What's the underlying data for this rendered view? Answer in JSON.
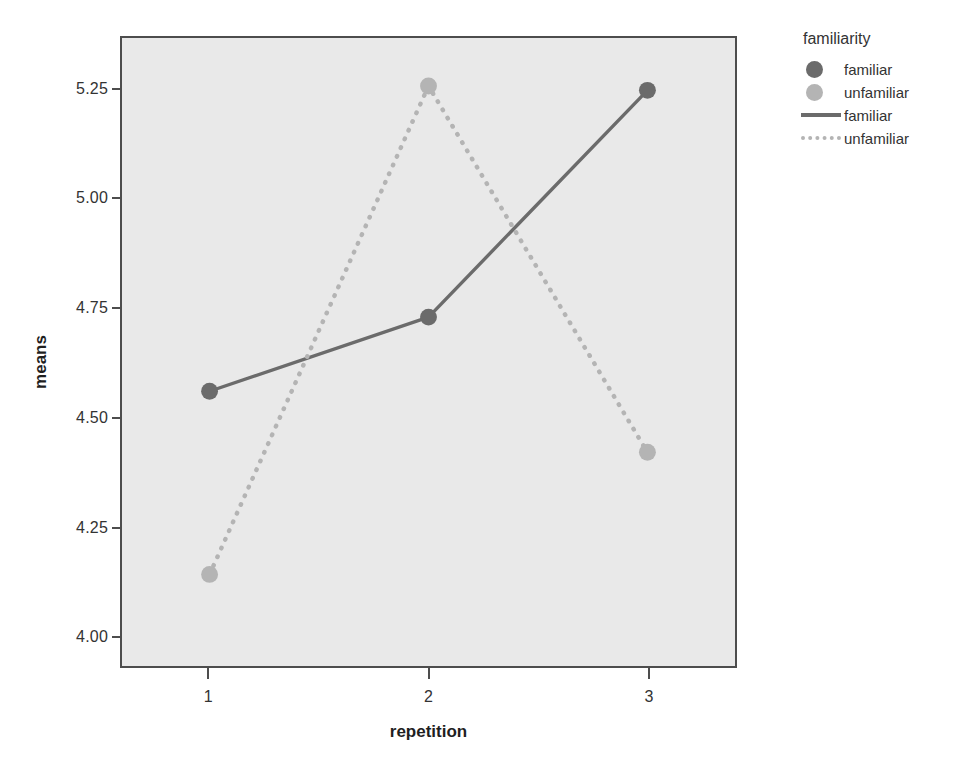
{
  "chart_data": {
    "type": "line",
    "title": "",
    "xlabel": "repetition",
    "ylabel": "means",
    "categories": [
      "1",
      "2",
      "3"
    ],
    "x": [
      1,
      2,
      3
    ],
    "xlim": [
      0.6,
      3.4
    ],
    "ylim": [
      3.93,
      5.37
    ],
    "yticks": [
      "4.00",
      "4.25",
      "4.50",
      "4.75",
      "5.00",
      "5.25"
    ],
    "ytick_values": [
      4.0,
      4.25,
      4.5,
      4.75,
      5.0,
      5.25
    ],
    "xticks": [
      "1",
      "2",
      "3"
    ],
    "grid": false,
    "legend_position": "right",
    "series": [
      {
        "name": "familiar",
        "values": [
          4.56,
          4.73,
          5.25
        ],
        "color": "#6b6b6b",
        "linestyle": "solid",
        "marker": "circle"
      },
      {
        "name": "unfamiliar",
        "values": [
          4.14,
          5.26,
          4.42
        ],
        "color": "#b4b4b4",
        "linestyle": "dotted",
        "marker": "circle"
      }
    ]
  },
  "legend": {
    "title": "familiarity",
    "entries": [
      {
        "label": "familiar",
        "key": "marker-circle",
        "color": "#6b6b6b"
      },
      {
        "label": "unfamiliar",
        "key": "marker-circle",
        "color": "#b4b4b4"
      },
      {
        "label": "familiar",
        "key": "line-solid",
        "color": "#6b6b6b"
      },
      {
        "label": "unfamiliar",
        "key": "line-dotted",
        "color": "#b4b4b4"
      }
    ]
  },
  "colors": {
    "plot_background": "#e9e9e9",
    "page_background": "#ffffff",
    "axis": "#4d4d4d",
    "familiar": "#6b6b6b",
    "unfamiliar": "#b4b4b4"
  }
}
